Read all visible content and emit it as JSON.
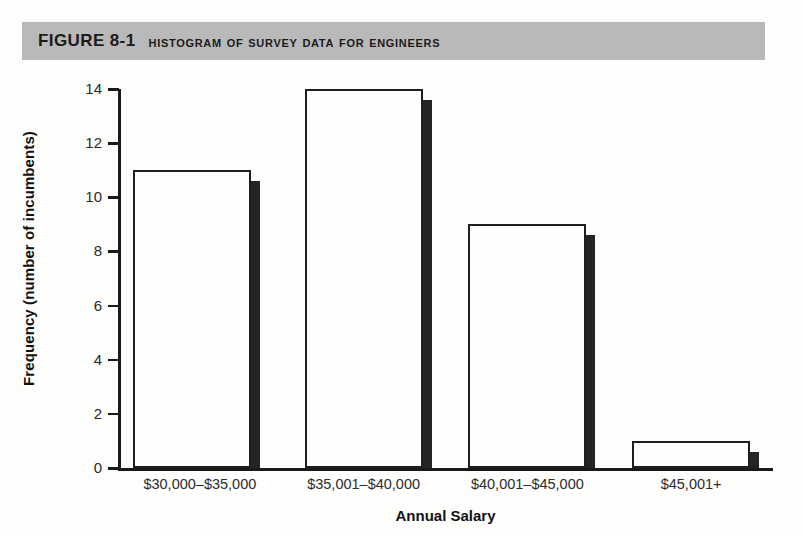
{
  "figure": {
    "number": "FIGURE 8-1",
    "caption": "Histogram of Survey Data for Engineers"
  },
  "chart_data": {
    "type": "bar",
    "title": "Histogram of Survey Data for Engineers",
    "xlabel": "Annual Salary",
    "ylabel": "Frequency (number of incumbents)",
    "categories": [
      "$30,000–$35,000",
      "$35,001–$40,000",
      "$40,001–$45,000",
      "$45,001+"
    ],
    "values": [
      11,
      14,
      9,
      1
    ],
    "ylim": [
      0,
      14
    ],
    "ytick_values": [
      0,
      2,
      4,
      6,
      8,
      10,
      12,
      14
    ],
    "ytick_labels": [
      "0",
      "2",
      "4",
      "6",
      "8",
      "10",
      "12",
      "14"
    ],
    "grid": false,
    "legend": false,
    "bar_style": "white fill, black outline, dark right drop shadow",
    "colors": {
      "bar_fill": "#fefefe",
      "bar_outline": "#1f1f1f",
      "bar_shadow": "#242424",
      "axis": "#1a1a1a",
      "title_band": "#b9b9b9",
      "page_background": "#fdfdfc"
    }
  }
}
